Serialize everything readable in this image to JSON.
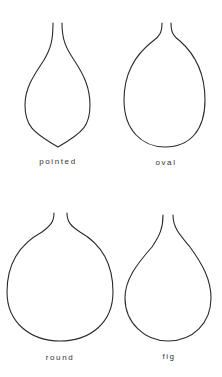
{
  "diagram": {
    "shapes": [
      {
        "label": "pointed"
      },
      {
        "label": "oval"
      },
      {
        "label": "round"
      },
      {
        "label": "fig"
      }
    ],
    "stroke_color": "#2a2a2a"
  }
}
